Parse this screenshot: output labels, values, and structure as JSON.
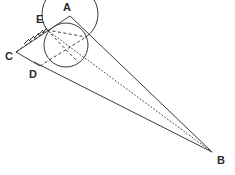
{
  "figure": {
    "type": "geometry-diagram",
    "background_color": "#ffffff",
    "stroke_color": "#3a3a3a",
    "label_color": "#2b2b2b",
    "width": 235,
    "height": 175
  },
  "labels": [
    {
      "id": "A",
      "text": "A",
      "x": 63,
      "y": 2
    },
    {
      "id": "E",
      "text": "E",
      "x": 36,
      "y": 14
    },
    {
      "id": "C",
      "text": "C",
      "x": 5,
      "y": 51
    },
    {
      "id": "D",
      "text": "D",
      "x": 29,
      "y": 69
    },
    {
      "id": "B",
      "text": "B",
      "x": 217,
      "y": 155
    }
  ],
  "points": {
    "A": {
      "x": 70,
      "y": 16
    },
    "B": {
      "x": 212,
      "y": 152
    },
    "C": {
      "x": 16,
      "y": 52
    },
    "D": {
      "x": 40,
      "y": 66
    },
    "E": {
      "x": 47,
      "y": 30
    },
    "T": {
      "x": 86,
      "y": 37
    },
    "M": {
      "x": 62,
      "y": 24
    },
    "K": {
      "x": 78,
      "y": 62
    }
  },
  "circle": {
    "center_x": 66,
    "center_y": 45,
    "radius": 22
  },
  "arc": {
    "center_x": 70,
    "center_y": 44,
    "radius": 28,
    "start_deg": 215,
    "end_deg": 80
  },
  "solid_lines": [
    {
      "name": "line-C-A",
      "x1": 16,
      "y1": 52,
      "x2": 70,
      "y2": 16
    },
    {
      "name": "line-C-D",
      "x1": 16,
      "y1": 52,
      "x2": 40,
      "y2": 66
    },
    {
      "name": "line-A-B",
      "x1": 70,
      "y1": 16,
      "x2": 212,
      "y2": 152
    },
    {
      "name": "line-D-B",
      "x1": 34,
      "y1": 62,
      "x2": 212,
      "y2": 152
    }
  ],
  "dashed_lines": [
    {
      "name": "chord-E-T",
      "x1": 47,
      "y1": 30,
      "x2": 86,
      "y2": 37
    },
    {
      "name": "chord-E-K",
      "x1": 47,
      "y1": 30,
      "x2": 78,
      "y2": 62
    },
    {
      "name": "chord-C-E",
      "x1": 16,
      "y1": 52,
      "x2": 47,
      "y2": 30
    },
    {
      "name": "chord-D-T",
      "x1": 40,
      "y1": 66,
      "x2": 86,
      "y2": 37
    }
  ],
  "dotted_lines": [
    {
      "name": "line-E-B",
      "x1": 47,
      "y1": 30,
      "x2": 212,
      "y2": 152
    }
  ],
  "hatch_marks": {
    "name": "angle-hatching-at-E",
    "count": 5,
    "origin_x": 22,
    "origin_y": 44
  }
}
